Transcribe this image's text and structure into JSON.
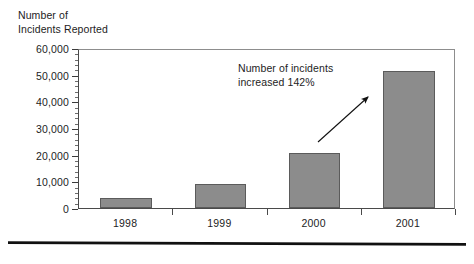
{
  "chart_data": {
    "type": "bar",
    "title": "Number of\nIncidents Reported",
    "title_line1": "Number of",
    "title_line2": "Incidents Reported",
    "xlabel": "",
    "ylabel": "Number of Incidents Reported",
    "categories": [
      "1998",
      "1999",
      "2000",
      "2001"
    ],
    "values": [
      3800,
      9000,
      20800,
      51500
    ],
    "ylim": [
      0,
      60000
    ],
    "ytick_values": [
      0,
      10000,
      20000,
      30000,
      40000,
      50000,
      60000
    ],
    "ytick_labels": [
      "0",
      "10,000",
      "20,000",
      "30,000",
      "40,000",
      "50,000",
      "60,000"
    ],
    "minor_tick_interval": 2000,
    "grid": false,
    "legend": null,
    "bar_color": "#8c8c8c",
    "bar_edge_color": "#5b5b5b",
    "annotations": [
      {
        "text": "Number of incidents\nincreased 142%",
        "line1": "Number of incidents",
        "line2": "increased 142%",
        "points_to": "2001"
      }
    ]
  },
  "colors": {
    "background": "#ffffff",
    "text": "#1d1d1d",
    "axis": "#4a4a4a",
    "frame": "#8d8d8d",
    "rule": "#111111"
  }
}
